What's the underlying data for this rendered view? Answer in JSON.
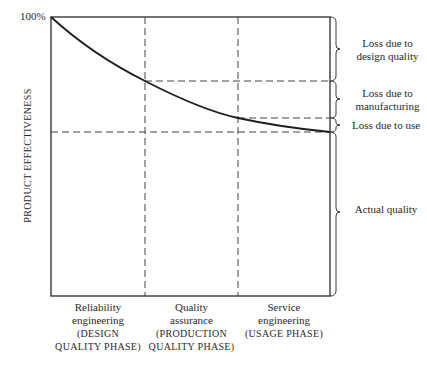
{
  "diagram": {
    "y_axis_label": "PRODUCT EFFECTIVENESS",
    "y_top_tick": "100%",
    "phases": [
      {
        "line1": "Reliability",
        "line2": "engineering",
        "line3": "(DESIGN",
        "line4": "QUALITY PHASE)"
      },
      {
        "line1": "Quality",
        "line2": "assurance",
        "line3": "(PRODUCTION",
        "line4": "QUALITY PHASE)"
      },
      {
        "line1": "Service",
        "line2": "engineering",
        "line3": "(USAGE PHASE)",
        "line4": ""
      }
    ],
    "brackets": [
      {
        "line1": "Loss due to",
        "line2": "design quality"
      },
      {
        "line1": "Loss due to",
        "line2": "manufacturing"
      },
      {
        "line1": "Loss due to use",
        "line2": ""
      },
      {
        "line1": "Actual quality",
        "line2": ""
      }
    ],
    "line_color": "#2a2a2a"
  }
}
